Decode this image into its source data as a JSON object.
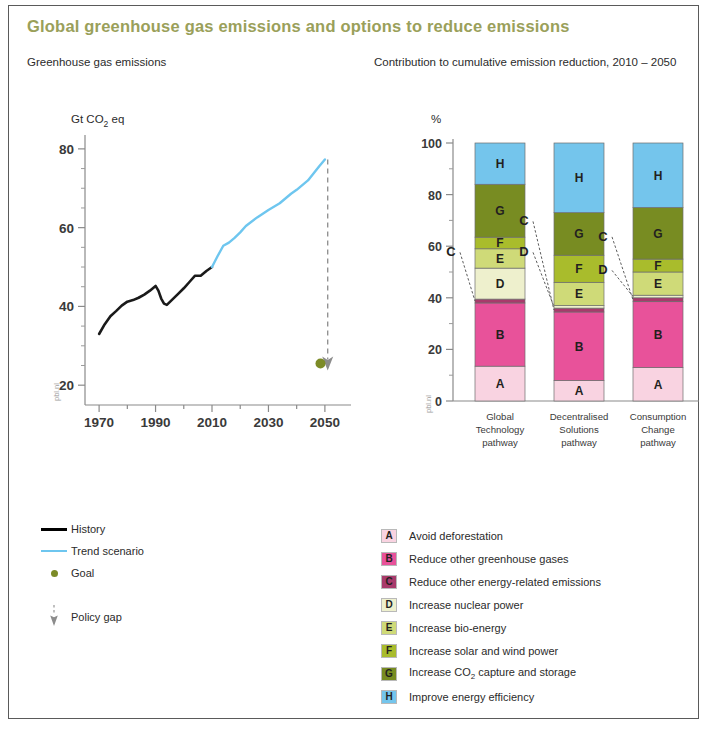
{
  "figure": {
    "title": "Global greenhouse gas emissions and options to reduce emissions",
    "left_subtitle": "Greenhouse gas emissions",
    "right_subtitle": "Contribution to cumulative emission reduction, 2010 – 2050",
    "watermark": "pbl.nl",
    "title_color": "#9aa05a",
    "frame_color": "#5a5a5a"
  },
  "left_legend": {
    "items": [
      {
        "key": "history-line",
        "label": "History",
        "color": "#000000"
      },
      {
        "key": "trend-line",
        "label": "Trend scenario",
        "color": "#6ec6ef"
      },
      {
        "key": "goal-dot",
        "label": "Goal",
        "color": "#7c8b27"
      },
      {
        "key": "policy-gap-arrow",
        "label": "Policy gap",
        "color": "#8c8c8c"
      }
    ]
  },
  "right_legend": {
    "items": [
      {
        "letter": "A",
        "label": "Avoid deforestation",
        "color": "#f9d3e1"
      },
      {
        "letter": "B",
        "label": "Reduce other greenhouse gases",
        "color": "#e8529a"
      },
      {
        "letter": "C",
        "label": "Reduce other energy-related emissions",
        "color": "#a83a6b"
      },
      {
        "letter": "D",
        "label": "Increase nuclear power",
        "color": "#eef0cd"
      },
      {
        "letter": "E",
        "label": "Increase bio-energy",
        "color": "#cfda78"
      },
      {
        "letter": "F",
        "label": "Increase solar and wind power",
        "color": "#a9bc2c"
      },
      {
        "letter": "G",
        "label": "Increase CO2 capture and storage",
        "color": "#788c22",
        "has_subscript": true,
        "label_before": "Increase CO",
        "label_sub": "2",
        "label_after": " capture and storage"
      },
      {
        "letter": "H",
        "label": "Improve energy efficiency",
        "color": "#74c5ec"
      }
    ]
  },
  "chart_data": [
    {
      "id": "emissions-line-chart",
      "type": "line",
      "title": "Greenhouse gas emissions",
      "ylabel": "Gt CO2 eq",
      "ylabel_before": "Gt CO",
      "ylabel_sub": "2",
      "ylabel_after": " eq",
      "xlabel": "",
      "xlim": [
        1965,
        2055
      ],
      "ylim": [
        17,
        82
      ],
      "yticks": [
        20,
        40,
        60,
        80
      ],
      "xticks": [
        1970,
        1990,
        2010,
        2030,
        2050
      ],
      "xminorticks": [
        1980,
        2000,
        2020,
        2040
      ],
      "grid": false,
      "series": [
        {
          "name": "History",
          "color": "#1a1a1a",
          "x": [
            1970,
            1972,
            1974,
            1976,
            1978,
            1980,
            1982,
            1984,
            1986,
            1988,
            1990,
            1991,
            1992,
            1993,
            1994,
            1996,
            1998,
            2000,
            2002,
            2004,
            2006,
            2008,
            2010
          ],
          "y": [
            33.0,
            35.5,
            37.5,
            38.8,
            40.2,
            41.2,
            41.6,
            42.2,
            43.0,
            44.0,
            45.2,
            44.0,
            42.0,
            40.7,
            40.4,
            41.8,
            43.2,
            44.6,
            46.2,
            47.8,
            47.8,
            49.0,
            50.0
          ]
        },
        {
          "name": "Trend scenario",
          "color": "#6ec6ef",
          "x": [
            2010,
            2012,
            2014,
            2016,
            2018,
            2020,
            2022,
            2026,
            2030,
            2034,
            2038,
            2040,
            2044,
            2048,
            2050
          ],
          "y": [
            50.0,
            52.8,
            55.4,
            56.2,
            57.4,
            58.8,
            60.4,
            62.6,
            64.5,
            66.2,
            68.6,
            69.6,
            72.0,
            75.6,
            77.3
          ]
        }
      ],
      "markers": [
        {
          "name": "Goal",
          "x": 2049.5,
          "y": 25.5,
          "color": "#7c8b27"
        }
      ],
      "annotations": [
        {
          "name": "Policy gap",
          "x": 2051,
          "y_from": 77.3,
          "y_to": 27.0,
          "style": "dashed-arrow",
          "color": "#8c8c8c"
        }
      ]
    },
    {
      "id": "reduction-contribution-chart",
      "type": "bar",
      "stacked": true,
      "title": "Contribution to cumulative emission reduction, 2010 – 2050",
      "ylabel": "%",
      "ylim": [
        0,
        100
      ],
      "yticks": [
        0,
        20,
        40,
        60,
        80,
        100
      ],
      "yminorticks": [
        10,
        30,
        50,
        70,
        90
      ],
      "grid": false,
      "categories": [
        "Global Technology pathway",
        "Decentralised Solutions pathway",
        "Consumption Change pathway"
      ],
      "category_lines": [
        [
          "Global",
          "Technology",
          "pathway"
        ],
        [
          "Decentralised",
          "Solutions",
          "pathway"
        ],
        [
          "Consumption",
          "Change",
          "pathway"
        ]
      ],
      "series": [
        {
          "name": "A",
          "label": "Avoid deforestation",
          "color": "#f9d3e1",
          "values": [
            13.5,
            8.0,
            13.0
          ]
        },
        {
          "name": "B",
          "label": "Reduce other greenhouse gases",
          "color": "#e8529a",
          "values": [
            24.5,
            26.5,
            25.5
          ]
        },
        {
          "name": "C",
          "label": "Reduce other energy-related emissions",
          "color": "#a83a6b",
          "values": [
            1.5,
            1.5,
            1.5
          ]
        },
        {
          "name": "D",
          "label": "Increase nuclear power",
          "color": "#eef0cd",
          "values": [
            12.0,
            1.0,
            1.0
          ]
        },
        {
          "name": "E",
          "label": "Increase bio-energy",
          "color": "#cfda78",
          "values": [
            7.5,
            9.0,
            9.0
          ]
        },
        {
          "name": "F",
          "label": "Increase solar and wind power",
          "color": "#a9bc2c",
          "values": [
            4.5,
            10.5,
            5.0
          ]
        },
        {
          "name": "G",
          "label": "Increase CO2 capture and storage",
          "color": "#788c22",
          "values": [
            20.5,
            16.5,
            20.0
          ]
        },
        {
          "name": "H",
          "label": "Improve energy efficiency",
          "color": "#74c5ec",
          "values": [
            16.0,
            27.0,
            25.0
          ]
        }
      ],
      "callouts": [
        {
          "letter": "C",
          "bar": 0
        },
        {
          "letter": "C",
          "bar": 1
        },
        {
          "letter": "D",
          "bar": 1
        },
        {
          "letter": "C",
          "bar": 2
        },
        {
          "letter": "D",
          "bar": 2
        }
      ]
    }
  ]
}
